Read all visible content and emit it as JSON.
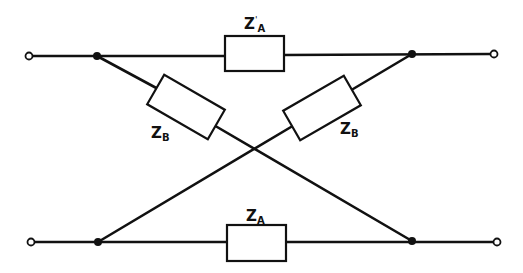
{
  "diagram": {
    "type": "lattice (X) network",
    "colors": {
      "line": "#111111",
      "background": "#ffffff"
    },
    "terminals": [
      {
        "id": "in-top",
        "x": 29,
        "y": 56
      },
      {
        "id": "out-top",
        "x": 494,
        "y": 56
      },
      {
        "id": "in-bottom",
        "x": 31,
        "y": 242
      },
      {
        "id": "out-bottom",
        "x": 497,
        "y": 242
      }
    ],
    "junctions": [
      {
        "id": "j-top-left",
        "x": 97,
        "y": 56
      },
      {
        "id": "j-top-right",
        "x": 412,
        "y": 54
      },
      {
        "id": "j-bottom-left",
        "x": 98,
        "y": 242
      },
      {
        "id": "j-bottom-right",
        "x": 412,
        "y": 241
      }
    ],
    "impedances": [
      {
        "id": "za-top",
        "symbol": "Z",
        "subscript": "A",
        "prime": true,
        "position": "top series arm"
      },
      {
        "id": "zb-left",
        "symbol": "Z",
        "subscript": "B",
        "prime": false,
        "position": "diagonal top-left to bottom-right"
      },
      {
        "id": "zb-right",
        "symbol": "Z",
        "subscript": "B",
        "prime": false,
        "position": "diagonal bottom-left to top-right"
      },
      {
        "id": "za-bottom",
        "symbol": "Z",
        "subscript": "A",
        "prime": false,
        "position": "bottom series arm"
      }
    ]
  },
  "labels": {
    "za_top": {
      "main": "Z",
      "sub": "A",
      "prime": "'"
    },
    "zb_left": {
      "main": "Z",
      "sub": "B"
    },
    "zb_right": {
      "main": "Z",
      "sub": "B"
    },
    "za_bottom": {
      "main": "Z",
      "sub": "A"
    }
  }
}
